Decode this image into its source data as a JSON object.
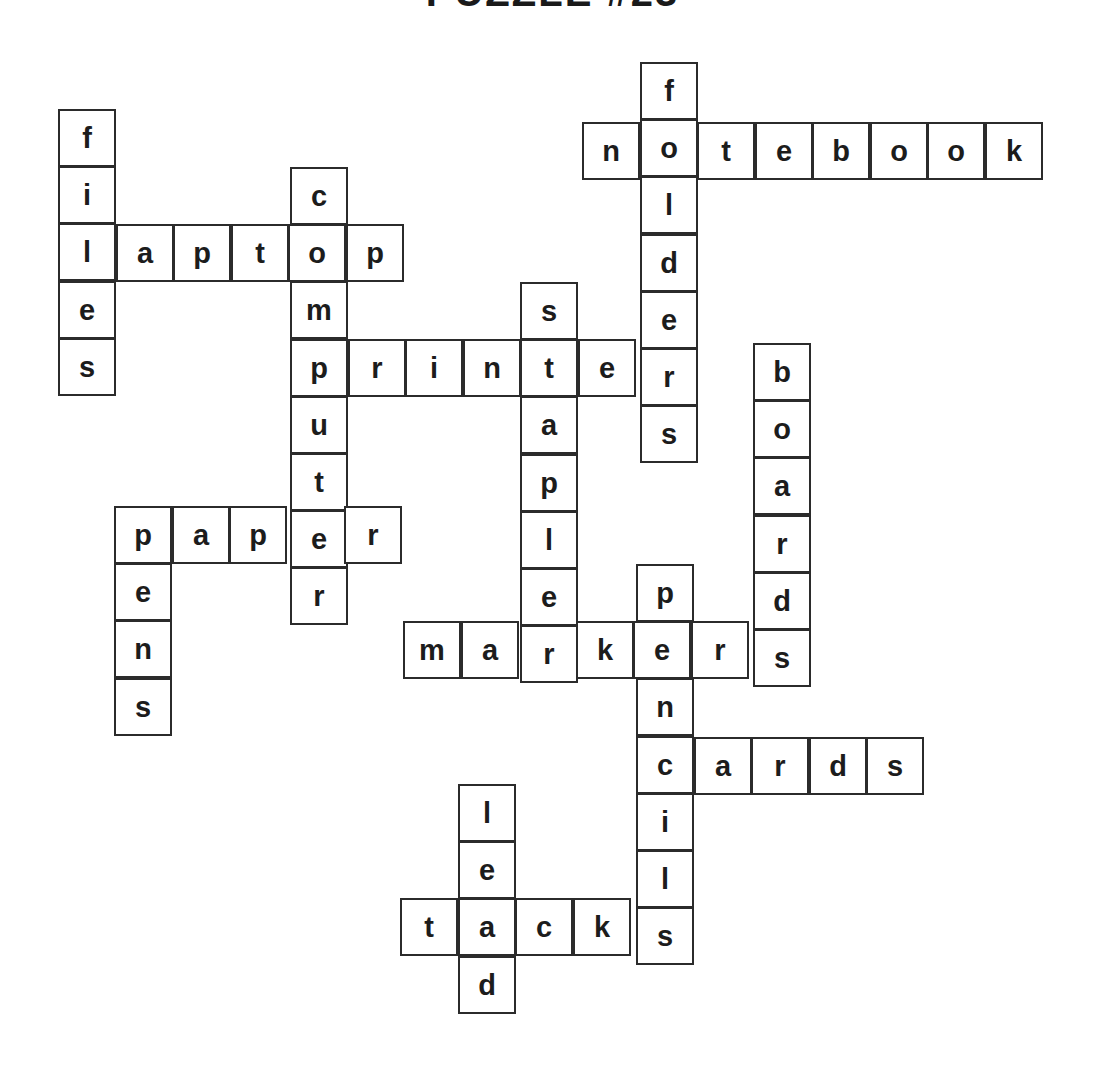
{
  "title": "PUZZLE #23",
  "cell_size": 58,
  "words": [
    {
      "word": "folders",
      "dir": "down",
      "x": 640,
      "y": 62
    },
    {
      "word": "notebook",
      "dir": "across",
      "x": 582,
      "y": 122
    },
    {
      "word": "files",
      "dir": "down",
      "x": 58,
      "y": 109
    },
    {
      "word": "laptop",
      "dir": "across",
      "x": 58,
      "y": 224
    },
    {
      "word": "computer",
      "dir": "down",
      "x": 290,
      "y": 167
    },
    {
      "word": "printer",
      "dir": "across",
      "x": 290,
      "y": 339
    },
    {
      "word": "stapler",
      "dir": "down",
      "x": 520,
      "y": 282
    },
    {
      "word": "boards",
      "dir": "down",
      "x": 753,
      "y": 343
    },
    {
      "word": "paper",
      "dir": "across",
      "x": 114,
      "y": 506
    },
    {
      "word": "pens",
      "dir": "down",
      "x": 114,
      "y": 506
    },
    {
      "word": "markers",
      "dir": "across",
      "x": 403,
      "y": 621
    },
    {
      "word": "pencils",
      "dir": "down",
      "x": 636,
      "y": 564
    },
    {
      "word": "cards",
      "dir": "across",
      "x": 636,
      "y": 737
    },
    {
      "word": "tacks",
      "dir": "across",
      "x": 400,
      "y": 898
    },
    {
      "word": "lead",
      "dir": "down",
      "x": 458,
      "y": 784
    }
  ]
}
